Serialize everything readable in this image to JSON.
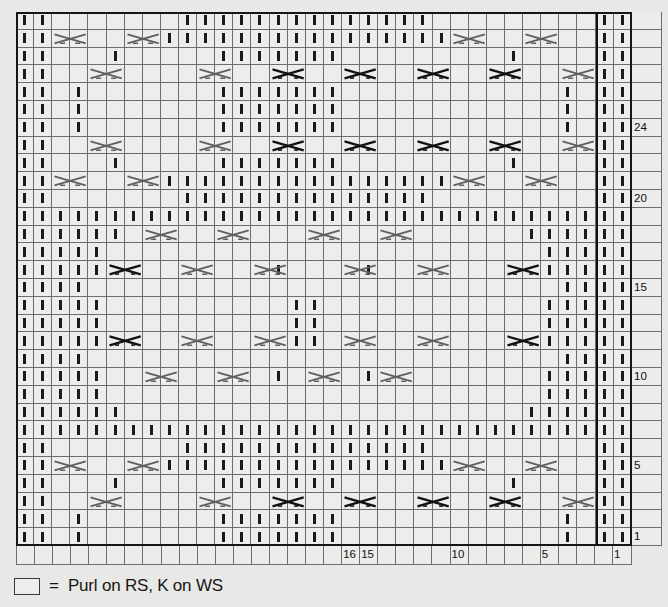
{
  "chart": {
    "columns": 34,
    "rows": 30,
    "cell_size_px": 18,
    "colors": {
      "background": "#e8e8e6",
      "cell": "#ededec",
      "gridline": "#6d6d6d",
      "frame": "#161616",
      "symbol": "#1a1a1a",
      "cable_light": "#5a5a5a"
    },
    "row_numbers": {
      "24": 24,
      "20": 20,
      "15": 15,
      "10": 10,
      "5": 5,
      "1": 1
    },
    "row_number_labels": [
      {
        "row": 24,
        "label": "24"
      },
      {
        "row": 20,
        "label": "20"
      },
      {
        "row": 15,
        "label": "15"
      },
      {
        "row": 10,
        "label": "10"
      },
      {
        "row": 5,
        "label": "5"
      },
      {
        "row": 1,
        "label": "1"
      }
    ],
    "column_number_labels": [
      {
        "col": 16,
        "label": "16"
      },
      {
        "col": 15,
        "label": "15"
      },
      {
        "col": 10,
        "label": "10"
      },
      {
        "col": 5,
        "label": "5"
      },
      {
        "col": 1,
        "label": "1"
      }
    ],
    "repeat_marker_column": 2,
    "legend": {
      "swatch": "empty-square",
      "equals": "=",
      "text": "Purl on RS, K on WS"
    }
  },
  "chart_data": {
    "type": "table",
    "columns": 34,
    "rows": 30,
    "symbols": {
      "blank": "Knit on RS, Purl on WS",
      "purl": "Purl on RS, K on WS",
      "cable_dark": "cable cross (dark)",
      "cable_light": "cable cross (light)"
    },
    "purl_cells": [
      {
        "row": 30,
        "cols": [
          1,
          2,
          12,
          13,
          14,
          15,
          16,
          17,
          18,
          19,
          20,
          21,
          22,
          23,
          24,
          25,
          33,
          34
        ]
      },
      {
        "row": 29,
        "cols": [
          1,
          2,
          11,
          12,
          13,
          14,
          15,
          16,
          17,
          18,
          19,
          20,
          21,
          22,
          23,
          24,
          25,
          26,
          33,
          34
        ]
      },
      {
        "row": 28,
        "cols": [
          1,
          2,
          7,
          17,
          18,
          19,
          20,
          21,
          22,
          23,
          29,
          33,
          34
        ]
      },
      {
        "row": 27,
        "cols": [
          1,
          2,
          33,
          34
        ]
      },
      {
        "row": 26,
        "cols": [
          1,
          2,
          4,
          17,
          18,
          19,
          20,
          21,
          22,
          23,
          31,
          33,
          34
        ]
      },
      {
        "row": 25,
        "cols": [
          1,
          2,
          4,
          17,
          18,
          19,
          20,
          21,
          22,
          23,
          31,
          33,
          34
        ]
      },
      {
        "row": 24,
        "cols": [
          1,
          2,
          4,
          17,
          18,
          19,
          20,
          21,
          22,
          23,
          31,
          33,
          34
        ]
      },
      {
        "row": 23,
        "cols": [
          1,
          2,
          33,
          34
        ]
      },
      {
        "row": 22,
        "cols": [
          1,
          2,
          7,
          17,
          18,
          19,
          20,
          21,
          22,
          23,
          29,
          33,
          34
        ]
      },
      {
        "row": 21,
        "cols": [
          1,
          2,
          11,
          12,
          13,
          14,
          15,
          16,
          17,
          18,
          19,
          20,
          21,
          22,
          23,
          24,
          25,
          26,
          33,
          34
        ]
      },
      {
        "row": 20,
        "cols": [
          1,
          2,
          12,
          13,
          14,
          15,
          16,
          17,
          18,
          19,
          20,
          21,
          22,
          23,
          24,
          25,
          33,
          34
        ]
      },
      {
        "row": 19,
        "cols": [
          1,
          2,
          3,
          4,
          5,
          6,
          7,
          8,
          9,
          10,
          11,
          12,
          13,
          14,
          15,
          16,
          17,
          18,
          19,
          20,
          21,
          22,
          23,
          24,
          25,
          26,
          27,
          28,
          29,
          30,
          31,
          32,
          33,
          34
        ]
      },
      {
        "row": 18,
        "cols": [
          1,
          2,
          3,
          4,
          5,
          6,
          29,
          30,
          31,
          32,
          33,
          34
        ]
      },
      {
        "row": 17,
        "cols": [
          1,
          2,
          3,
          4,
          5,
          30,
          31,
          32,
          33,
          34
        ]
      },
      {
        "row": 16,
        "cols": [
          1,
          2,
          3,
          4,
          5,
          15,
          20,
          30,
          31,
          32,
          33,
          34
        ]
      },
      {
        "row": 15,
        "cols": [
          1,
          2,
          3,
          4,
          31,
          32,
          33,
          34
        ]
      },
      {
        "row": 14,
        "cols": [
          1,
          2,
          3,
          4,
          5,
          18,
          19,
          30,
          31,
          32,
          33,
          34
        ]
      },
      {
        "row": 13,
        "cols": [
          1,
          2,
          3,
          4,
          5,
          18,
          19,
          30,
          31,
          32,
          33,
          34
        ]
      },
      {
        "row": 12,
        "cols": [
          1,
          2,
          3,
          4,
          5,
          18,
          19,
          30,
          31,
          32,
          33,
          34
        ]
      },
      {
        "row": 11,
        "cols": [
          1,
          2,
          3,
          4,
          31,
          32,
          33,
          34
        ]
      },
      {
        "row": 10,
        "cols": [
          1,
          2,
          3,
          4,
          5,
          15,
          20,
          30,
          31,
          32,
          33,
          34
        ]
      },
      {
        "row": 9,
        "cols": [
          1,
          2,
          3,
          4,
          5,
          30,
          31,
          32,
          33,
          34
        ]
      },
      {
        "row": 8,
        "cols": [
          1,
          2,
          3,
          4,
          5,
          6,
          29,
          30,
          31,
          32,
          33,
          34
        ]
      },
      {
        "row": 7,
        "cols": [
          1,
          2,
          3,
          4,
          5,
          6,
          7,
          8,
          9,
          10,
          11,
          12,
          13,
          14,
          15,
          16,
          17,
          18,
          19,
          20,
          21,
          22,
          23,
          24,
          25,
          26,
          27,
          28,
          29,
          30,
          31,
          32,
          33,
          34
        ]
      },
      {
        "row": 6,
        "cols": [
          1,
          2,
          12,
          13,
          14,
          15,
          16,
          17,
          18,
          19,
          20,
          21,
          22,
          23,
          24,
          25,
          33,
          34
        ]
      },
      {
        "row": 5,
        "cols": [
          1,
          2,
          11,
          12,
          13,
          14,
          15,
          16,
          17,
          18,
          19,
          20,
          21,
          22,
          23,
          24,
          25,
          26,
          33,
          34
        ]
      },
      {
        "row": 4,
        "cols": [
          1,
          2,
          7,
          17,
          18,
          19,
          20,
          21,
          22,
          23,
          29,
          33,
          34
        ]
      },
      {
        "row": 3,
        "cols": [
          1,
          2,
          33,
          34
        ]
      },
      {
        "row": 2,
        "cols": [
          1,
          2,
          4,
          17,
          18,
          19,
          20,
          21,
          22,
          23,
          31,
          33,
          34
        ]
      },
      {
        "row": 1,
        "cols": [
          1,
          2,
          4,
          17,
          18,
          19,
          20,
          21,
          22,
          23,
          31,
          33,
          34
        ]
      }
    ],
    "cables": [
      {
        "row": 29,
        "col": 5,
        "style": "light"
      },
      {
        "row": 29,
        "col": 9,
        "style": "light"
      },
      {
        "row": 29,
        "col": 27,
        "style": "light"
      },
      {
        "row": 29,
        "col": 31,
        "style": "light"
      },
      {
        "row": 27,
        "col": 3,
        "style": "light"
      },
      {
        "row": 27,
        "col": 7,
        "style": "dark"
      },
      {
        "row": 27,
        "col": 11,
        "style": "dark"
      },
      {
        "row": 27,
        "col": 15,
        "style": "dark"
      },
      {
        "row": 27,
        "col": 19,
        "style": "dark"
      },
      {
        "row": 27,
        "col": 23,
        "style": "light"
      },
      {
        "row": 27,
        "col": 29,
        "style": "light"
      },
      {
        "row": 23,
        "col": 3,
        "style": "light"
      },
      {
        "row": 23,
        "col": 7,
        "style": "dark"
      },
      {
        "row": 23,
        "col": 11,
        "style": "dark"
      },
      {
        "row": 23,
        "col": 15,
        "style": "dark"
      },
      {
        "row": 23,
        "col": 19,
        "style": "dark"
      },
      {
        "row": 23,
        "col": 23,
        "style": "light"
      },
      {
        "row": 23,
        "col": 29,
        "style": "light"
      },
      {
        "row": 21,
        "col": 5,
        "style": "light"
      },
      {
        "row": 21,
        "col": 9,
        "style": "light"
      },
      {
        "row": 21,
        "col": 27,
        "style": "light"
      },
      {
        "row": 21,
        "col": 31,
        "style": "light"
      },
      {
        "row": 18,
        "col": 13,
        "style": "light"
      },
      {
        "row": 18,
        "col": 17,
        "style": "light"
      },
      {
        "row": 18,
        "col": 22,
        "style": "light"
      },
      {
        "row": 18,
        "col": 26,
        "style": "light"
      },
      {
        "row": 16,
        "col": 6,
        "style": "dark"
      },
      {
        "row": 16,
        "col": 11,
        "style": "light"
      },
      {
        "row": 16,
        "col": 15,
        "style": "light"
      },
      {
        "row": 16,
        "col": 20,
        "style": "light"
      },
      {
        "row": 16,
        "col": 24,
        "style": "light"
      },
      {
        "row": 16,
        "col": 28,
        "style": "dark"
      },
      {
        "row": 12,
        "col": 6,
        "style": "dark"
      },
      {
        "row": 12,
        "col": 11,
        "style": "light"
      },
      {
        "row": 12,
        "col": 15,
        "style": "light"
      },
      {
        "row": 12,
        "col": 20,
        "style": "light"
      },
      {
        "row": 12,
        "col": 24,
        "style": "light"
      },
      {
        "row": 12,
        "col": 28,
        "style": "dark"
      },
      {
        "row": 10,
        "col": 13,
        "style": "light"
      },
      {
        "row": 10,
        "col": 17,
        "style": "light"
      },
      {
        "row": 10,
        "col": 22,
        "style": "light"
      },
      {
        "row": 10,
        "col": 26,
        "style": "light"
      },
      {
        "row": 5,
        "col": 5,
        "style": "light"
      },
      {
        "row": 5,
        "col": 9,
        "style": "light"
      },
      {
        "row": 5,
        "col": 27,
        "style": "light"
      },
      {
        "row": 5,
        "col": 31,
        "style": "light"
      },
      {
        "row": 3,
        "col": 3,
        "style": "light"
      },
      {
        "row": 3,
        "col": 7,
        "style": "dark"
      },
      {
        "row": 3,
        "col": 11,
        "style": "dark"
      },
      {
        "row": 3,
        "col": 15,
        "style": "dark"
      },
      {
        "row": 3,
        "col": 19,
        "style": "dark"
      },
      {
        "row": 3,
        "col": 23,
        "style": "light"
      },
      {
        "row": 3,
        "col": 29,
        "style": "light"
      }
    ]
  }
}
